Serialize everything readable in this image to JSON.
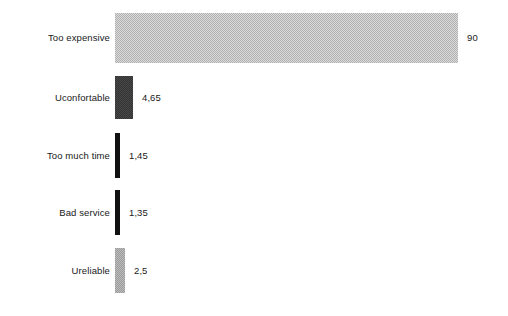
{
  "chart_data": {
    "type": "bar",
    "orientation": "horizontal",
    "title": "",
    "subtitle": "",
    "xlabel": "",
    "ylabel": "",
    "grid": false,
    "legend": false,
    "legend_position": "none",
    "axis_visible": false,
    "xlim": [
      0,
      90
    ],
    "categories": [
      "Too expensive",
      "Uconfortable",
      "Too much time",
      "Bad service",
      "Ureliable"
    ],
    "values": [
      90,
      4.65,
      1.45,
      1.35,
      2.5
    ],
    "value_labels": [
      "90",
      "4,65",
      "1,45",
      "1,35",
      "2,5"
    ],
    "bars": [
      {
        "category": "Too expensive",
        "value": 90,
        "value_label": "90",
        "color": "#b0b0b0",
        "fill_style": "fill-dither-light",
        "px_top": 13,
        "px_height": 50,
        "px_width": 343
      },
      {
        "category": "Uconfortable",
        "value": 4.65,
        "value_label": "4,65",
        "color": "#333333",
        "fill_style": "fill-dark",
        "px_top": 76,
        "px_height": 43,
        "px_width": 18
      },
      {
        "category": "Too much time",
        "value": 1.45,
        "value_label": "1,45",
        "color": "#111111",
        "fill_style": "fill-black",
        "px_top": 133,
        "px_height": 45,
        "px_width": 5
      },
      {
        "category": "Bad service",
        "value": 1.35,
        "value_label": "1,35",
        "color": "#111111",
        "fill_style": "fill-black",
        "px_top": 190,
        "px_height": 45,
        "px_width": 5
      },
      {
        "category": "Ureliable",
        "value": 2.5,
        "value_label": "2,5",
        "color": "#9a9a9a",
        "fill_style": "fill-mid",
        "px_top": 248,
        "px_height": 45,
        "px_width": 10
      }
    ],
    "background_color": "#ffffff",
    "text_color": "#1a1a1a"
  }
}
